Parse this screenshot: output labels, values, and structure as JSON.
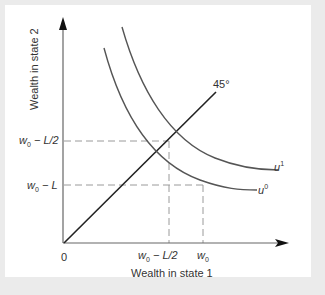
{
  "figure": {
    "x_axis_label": "Wealth in state 1",
    "y_axis_label": "Wealth in state 2",
    "origin_label": "0",
    "angle_label": "45°",
    "y_ticks": [
      {
        "var": "w",
        "sub": "0",
        "rest": " − L/2"
      },
      {
        "var": "w",
        "sub": "0",
        "rest": " − L"
      }
    ],
    "x_ticks": [
      {
        "var": "w",
        "sub": "0",
        "rest": " − L/2"
      },
      {
        "var": "w",
        "sub": "0",
        "rest": ""
      }
    ],
    "curves": [
      {
        "name": "u",
        "sup": "1"
      },
      {
        "name": "u",
        "sup": "0"
      }
    ],
    "colors": {
      "frame": "#ebebeb",
      "panel": "#ffffff",
      "axis": "#555555",
      "curve": "#555555",
      "line45": "#222222",
      "dashed": "#999999"
    }
  }
}
